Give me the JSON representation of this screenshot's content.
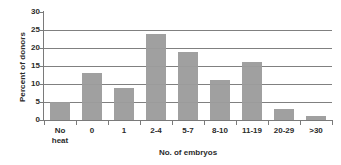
{
  "chart_data": {
    "type": "bar",
    "title": "",
    "subtitle": "",
    "categories": [
      "No\nheat",
      "0",
      "1",
      "2-4",
      "5-7",
      "8-10",
      "11-19",
      "20-29",
      ">30"
    ],
    "values": [
      5,
      13,
      9,
      24,
      19,
      11,
      16,
      3,
      1
    ],
    "xlabel": "No. of embryos",
    "ylabel": "Percent of donors",
    "ylim": [
      0,
      30
    ],
    "yticks": [
      0,
      5,
      10,
      15,
      20,
      25,
      30
    ],
    "ytick_labels": [
      "0",
      "5",
      "10",
      "15",
      "20",
      "25",
      "30"
    ],
    "gridlines": [
      5,
      10,
      15,
      20,
      25
    ],
    "grid": true,
    "legend": false,
    "legend_position": "none",
    "bar_color": "#9c9c9c",
    "axis_color": "#7a7a7a",
    "grid_color": "#808080",
    "text_color": "#2b2b2b",
    "background": "#ffffff"
  }
}
